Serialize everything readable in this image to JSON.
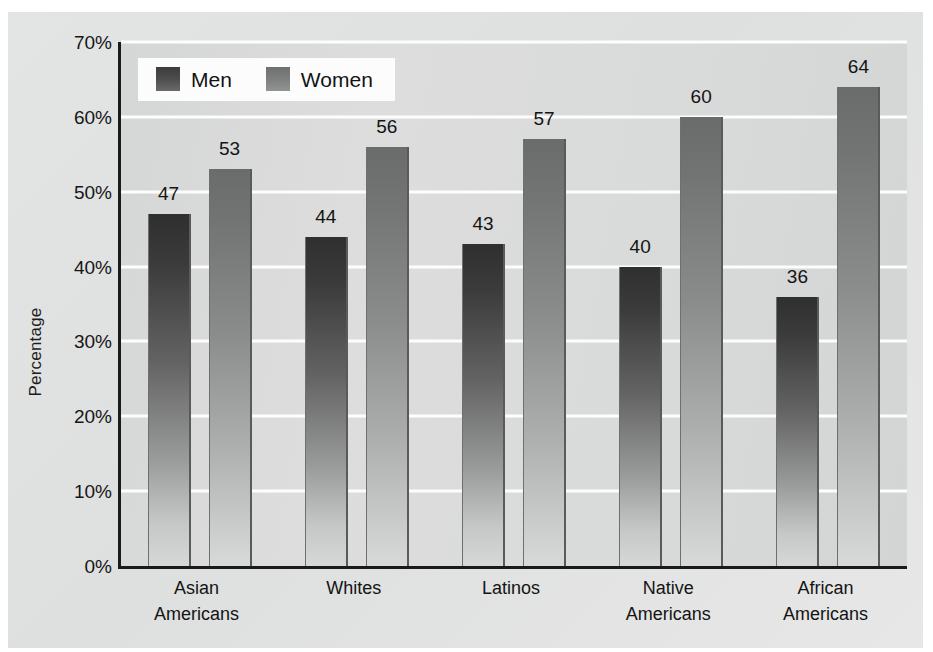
{
  "chart_data": {
    "type": "bar",
    "title": "",
    "xlabel": "",
    "ylabel": "Percentage",
    "ylim": [
      0,
      70
    ],
    "ytick_labels": [
      "0%",
      "10%",
      "20%",
      "30%",
      "40%",
      "50%",
      "60%",
      "70%"
    ],
    "ytick_values": [
      0,
      10,
      20,
      30,
      40,
      50,
      60,
      70
    ],
    "grid": true,
    "legend_position": "top-left",
    "categories": [
      [
        "Asian",
        "Americans"
      ],
      [
        "Whites"
      ],
      [
        "Latinos"
      ],
      [
        "Native",
        "Americans"
      ],
      [
        "African",
        "Americans"
      ]
    ],
    "category_labels": [
      "Asian Americans",
      "Whites",
      "Latinos",
      "Native Americans",
      "African Americans"
    ],
    "series": [
      {
        "name": "Men",
        "values": [
          47,
          44,
          43,
          40,
          36
        ],
        "color": "#3b3b3b"
      },
      {
        "name": "Women",
        "values": [
          53,
          56,
          57,
          60,
          64
        ],
        "color": "#737474"
      }
    ]
  },
  "legend": {
    "entries": [
      {
        "label": "Men"
      },
      {
        "label": "Women"
      }
    ]
  },
  "colors": {
    "card_background": "#e1e2e2",
    "plot_background": "#d8d9d9",
    "gridline": "#fdfdfd",
    "axis": "#1a1a1a",
    "text": "#141414",
    "legend_background": "#fcfcfc"
  }
}
